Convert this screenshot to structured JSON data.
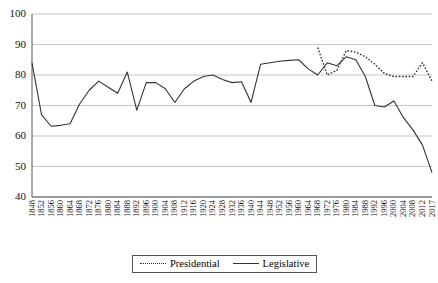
{
  "chart_data": {
    "type": "line",
    "title": "",
    "subtitle": "",
    "xlabel": "",
    "ylabel": "",
    "ylim": [
      40,
      100
    ],
    "yticks": [
      40,
      50,
      60,
      70,
      80,
      90,
      100
    ],
    "grid": true,
    "legend_position": "bottom-center",
    "x": [
      1848,
      1852,
      1856,
      1860,
      1864,
      1868,
      1872,
      1876,
      1880,
      1884,
      1888,
      1892,
      1896,
      1900,
      1904,
      1908,
      1912,
      1916,
      1920,
      1924,
      1928,
      1932,
      1936,
      1940,
      1944,
      1948,
      1952,
      1956,
      1960,
      1964,
      1968,
      1972,
      1976,
      1980,
      1984,
      1988,
      1992,
      1996,
      2000,
      2004,
      2008,
      2012,
      2017
    ],
    "xticklabels": [
      "1848",
      "1852",
      "1856",
      "1860",
      "1864",
      "1868",
      "1872",
      "1876",
      "1880",
      "1884",
      "1888",
      "1892",
      "1896",
      "1900",
      "1904",
      "1908",
      "1912",
      "1916",
      "1920",
      "1924",
      "1928",
      "1932",
      "1936",
      "1940",
      "1944",
      "1948",
      "1952",
      "1956",
      "1960",
      "1964",
      "1968",
      "1972",
      "1976",
      "1980",
      "1984",
      "1988",
      "1992",
      "1996",
      "2000",
      "2004",
      "2008",
      "2012",
      "2017"
    ],
    "series": [
      {
        "name": "Presidential",
        "style": "dotted",
        "color": "#333333",
        "values": [
          null,
          null,
          null,
          null,
          null,
          null,
          null,
          null,
          null,
          null,
          null,
          null,
          null,
          null,
          null,
          null,
          null,
          null,
          null,
          null,
          null,
          null,
          null,
          null,
          null,
          null,
          null,
          null,
          null,
          null,
          89.0,
          80.0,
          81.5,
          88.0,
          87.5,
          86.0,
          83.5,
          80.5,
          79.5,
          79.5,
          79.5,
          84.0,
          78.0
        ]
      },
      {
        "name": "Legislative",
        "style": "solid",
        "color": "#333333",
        "values": [
          84.0,
          67.0,
          63.2,
          63.5,
          64.0,
          70.5,
          75.0,
          78.0,
          76.0,
          74.0,
          81.0,
          68.5,
          77.5,
          77.5,
          75.5,
          71.0,
          75.5,
          78.0,
          79.5,
          80.0,
          78.5,
          77.5,
          77.8,
          71.0,
          83.5,
          84.0,
          84.5,
          84.8,
          85.0,
          82.0,
          80.0,
          84.0,
          83.0,
          86.0,
          85.0,
          79.5,
          70.0,
          69.5,
          71.5,
          66.0,
          62.0,
          57.0,
          48.0
        ]
      }
    ],
    "legend": [
      {
        "label": "Presidential",
        "style": "dotted"
      },
      {
        "label": "Legislative",
        "style": "solid"
      }
    ]
  },
  "axes": {
    "y_tick_labels": [
      "100",
      "90",
      "80",
      "70",
      "60",
      "50",
      "40"
    ]
  }
}
